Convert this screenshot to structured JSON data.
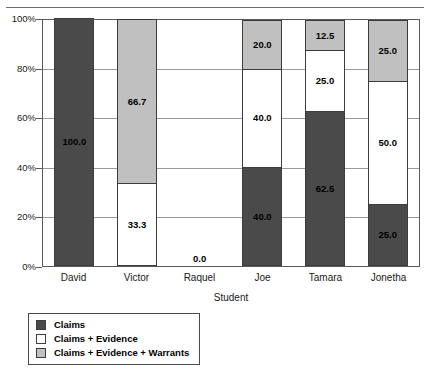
{
  "chart_data": {
    "type": "bar",
    "subtype": "stacked-100-percent",
    "title": "",
    "xlabel": "Student",
    "ylabel": "",
    "categories": [
      "David",
      "Victor",
      "Raquel",
      "Joe",
      "Tamara",
      "Jonetha"
    ],
    "series": [
      {
        "name": "Claims",
        "color": "#4a4a4a",
        "values": [
          100.0,
          0.0,
          0.0,
          40.0,
          62.5,
          25.0
        ],
        "labels": [
          "100.0",
          "",
          "",
          "40.0",
          "62.5",
          "25.0"
        ]
      },
      {
        "name": "Claims + Evidence",
        "color": "#ffffff",
        "values": [
          0.0,
          33.3,
          0.0,
          40.0,
          25.0,
          50.0
        ],
        "labels": [
          "",
          "33.3",
          "",
          "40.0",
          "25.0",
          "50.0"
        ]
      },
      {
        "name": "Claims + Evidence + Warrants",
        "color": "#c0c0c0",
        "values": [
          0.0,
          66.7,
          0.0,
          20.0,
          12.5,
          25.0
        ],
        "labels": [
          "",
          "66.7",
          "",
          "20.0",
          "12.5",
          "25.0"
        ]
      }
    ],
    "empty_category_labels": {
      "Raquel": "0.0"
    },
    "ylim": [
      0,
      100
    ],
    "yticks": [
      "0%",
      "20%",
      "40%",
      "60%",
      "80%",
      "100%"
    ],
    "ytick_values": [
      0,
      20,
      40,
      60,
      80,
      100
    ],
    "grid": true,
    "legend_position": "bottom-left"
  },
  "yaxis": {
    "ticks": [
      {
        "label": "100%",
        "value": 100
      },
      {
        "label": "80%",
        "value": 80
      },
      {
        "label": "60%",
        "value": 60
      },
      {
        "label": "40%",
        "value": 40
      },
      {
        "label": "20%",
        "value": 20
      },
      {
        "label": "0%",
        "value": 0
      }
    ]
  },
  "xaxis": {
    "title": "Student",
    "ticks": [
      "David",
      "Victor",
      "Raquel",
      "Joe",
      "Tamara",
      "Jonetha"
    ]
  },
  "legend": {
    "items": [
      {
        "label": "Claims",
        "color": "#4a4a4a"
      },
      {
        "label": "Claims + Evidence",
        "color": "#ffffff"
      },
      {
        "label": "Claims + Evidence + Warrants",
        "color": "#c0c0c0"
      }
    ]
  },
  "colors": {
    "claims": "#4a4a4a",
    "claims_evidence": "#ffffff",
    "claims_evidence_warrants": "#c0c0c0",
    "axis": "#5a5a5a",
    "grid": "#9a9a9a",
    "rule": "#6e6e6e"
  }
}
